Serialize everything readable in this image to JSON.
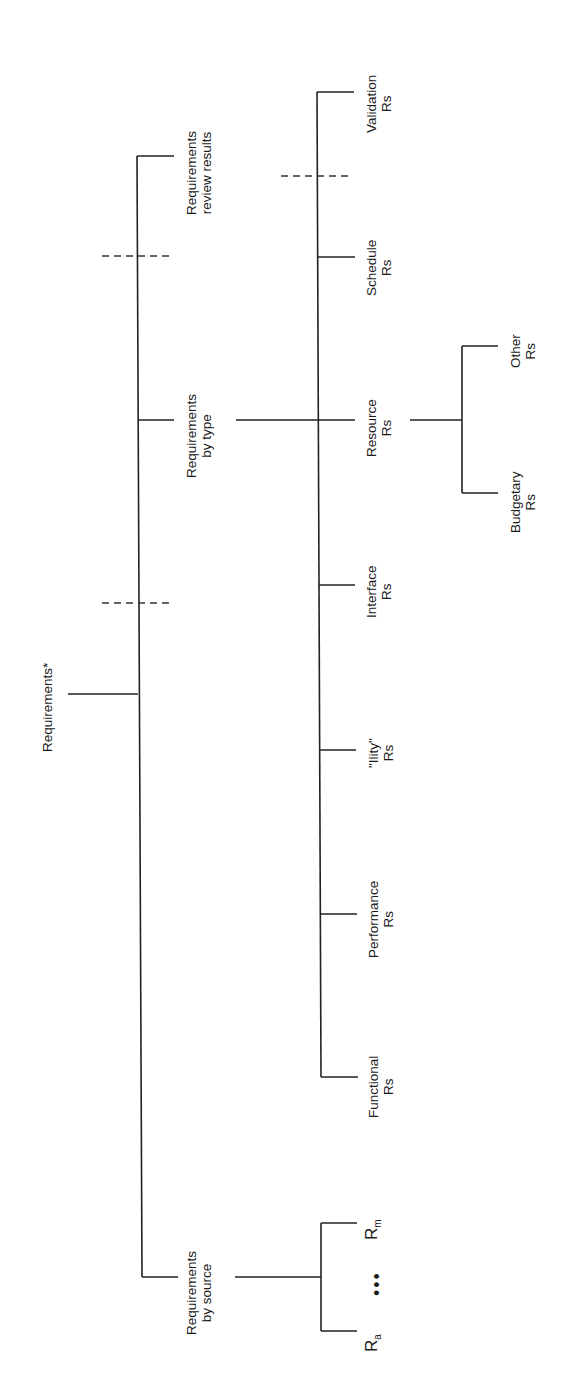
{
  "diagram": {
    "type": "tree",
    "orientation": "rotated-90-ccw",
    "root": {
      "label": "Requirements*",
      "children": [
        {
          "label_line1": "Requirements",
          "label_line2": "by source",
          "children": [
            {
              "label": "R",
              "subscript": "a"
            },
            {
              "label": "•••"
            },
            {
              "label": "R",
              "subscript": "m"
            }
          ]
        },
        {
          "label_line1": "Requirements",
          "label_line2": "by type",
          "children": [
            {
              "label_line1": "Functional",
              "label_line2": "Rs"
            },
            {
              "label_line1": "Performance",
              "label_line2": "Rs"
            },
            {
              "label_line1": "\"Ility\"",
              "label_line2": "Rs"
            },
            {
              "label_line1": "Interface",
              "label_line2": "Rs"
            },
            {
              "label_line1": "Resource",
              "label_line2": "Rs",
              "children": [
                {
                  "label_line1": "Budgetary",
                  "label_line2": "Rs"
                },
                {
                  "label_line1": "Other",
                  "label_line2": "Rs"
                }
              ]
            },
            {
              "label_line1": "Schedule",
              "label_line2": "Rs"
            },
            {
              "label_line1": "Validation",
              "label_line2": "Rs"
            }
          ]
        },
        {
          "label_line1": "Requirements",
          "label_line2": "review results"
        }
      ]
    }
  }
}
